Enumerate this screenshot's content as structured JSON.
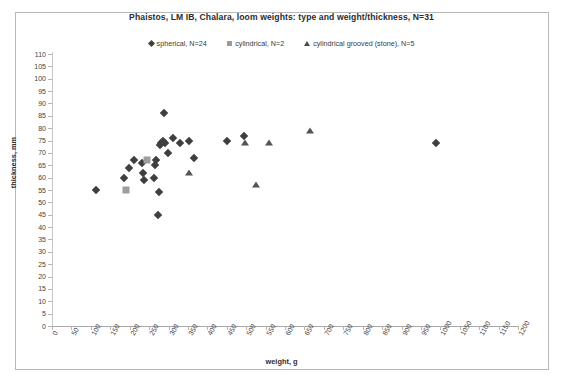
{
  "chart_data": {
    "type": "scatter",
    "title": "Phaistos, LM IB, Chalara,  loom weights: type and weight/thickness, N=31",
    "xlabel": "weight, g",
    "ylabel": "thickness, mm",
    "xlim": [
      0,
      1200
    ],
    "ylim": [
      0,
      110
    ],
    "xticks": [
      0,
      50,
      100,
      150,
      200,
      250,
      300,
      350,
      400,
      450,
      500,
      550,
      600,
      650,
      700,
      750,
      800,
      850,
      900,
      950,
      1000,
      1050,
      1100,
      1150,
      1200
    ],
    "yticks": [
      0,
      5,
      10,
      15,
      20,
      25,
      30,
      35,
      40,
      45,
      50,
      55,
      60,
      65,
      70,
      75,
      80,
      85,
      90,
      95,
      100,
      105,
      110
    ],
    "grid": false,
    "legend_position": "top",
    "series": [
      {
        "name": "spherical, N=24",
        "marker": "diamond",
        "color": "#3f3f3f",
        "points": [
          [
            113,
            55
          ],
          [
            185,
            60
          ],
          [
            198,
            64
          ],
          [
            212,
            67
          ],
          [
            232,
            66
          ],
          [
            235,
            62
          ],
          [
            238,
            59
          ],
          [
            262,
            60
          ],
          [
            264,
            65
          ],
          [
            268,
            67
          ],
          [
            272,
            45
          ],
          [
            275,
            54
          ],
          [
            278,
            73
          ],
          [
            281,
            74
          ],
          [
            285,
            75
          ],
          [
            288,
            86
          ],
          [
            292,
            74
          ],
          [
            298,
            70
          ],
          [
            312,
            76
          ],
          [
            330,
            74
          ],
          [
            352,
            75
          ],
          [
            365,
            68
          ],
          [
            450,
            75
          ],
          [
            495,
            77
          ],
          [
            990,
            74
          ]
        ]
      },
      {
        "name": "cylindrical, N=2",
        "marker": "square",
        "color": "#9e9e9e",
        "points": [
          [
            190,
            55
          ],
          [
            245,
            67
          ]
        ]
      },
      {
        "name": "cylindrical grooved (stone), N=5",
        "marker": "triangle",
        "color": "#555555",
        "points": [
          [
            352,
            62
          ],
          [
            498,
            74
          ],
          [
            525,
            57
          ],
          [
            560,
            74
          ],
          [
            665,
            79
          ]
        ]
      }
    ]
  },
  "legend": [
    {
      "label": "spherical, N=24",
      "marker": "diamond"
    },
    {
      "label": "cylindrical, N=2",
      "marker": "square"
    },
    {
      "label": "cylindrical grooved (stone), N=5",
      "marker": "triangle"
    }
  ]
}
